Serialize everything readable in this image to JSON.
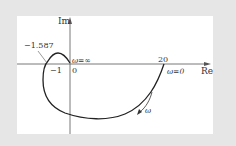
{
  "diagram": {
    "type": "nyquist-plot",
    "axes": {
      "real_label": "Re",
      "imag_label": "Im"
    },
    "labels": {
      "origin": "0",
      "minus_one": "−1",
      "crossing_value": "−1.587",
      "start_value": "20",
      "omega_zero": "ω=0",
      "omega_infinity": "ω=∞",
      "omega_direction": "ω"
    },
    "colors": {
      "background": "#e6e6e6",
      "panel": "#ffffff",
      "curve": "#222222",
      "axis": "#555555"
    }
  }
}
